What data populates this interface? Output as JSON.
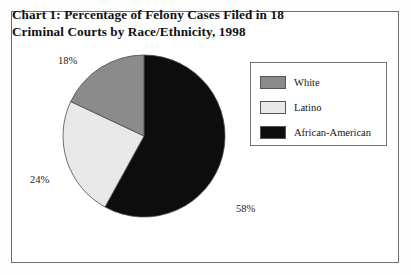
{
  "chart_data": {
    "type": "pie",
    "title": "Chart 1: Percentage of Felony Cases Filed in 18 Criminal Courts by Race/Ethnicity, 1998",
    "title_lines": [
      "Chart 1: Percentage of Felony Cases Filed in 18",
      "Criminal Courts by Race/Ethnicity, 1998"
    ],
    "categories": [
      "African-American",
      "Latino",
      "White"
    ],
    "values": [
      58,
      24,
      18
    ],
    "value_labels": [
      "58%",
      "24%",
      "18%"
    ],
    "slice_colors": [
      "#0d0d0d",
      "#e9e9e9",
      "#8b8b8b"
    ],
    "xlabel": "",
    "ylabel": "",
    "grid": false,
    "legend_position": "right",
    "start_angle_deg": 0,
    "direction": "clockwise",
    "slices": [
      {
        "label": "African-American",
        "value": 58,
        "value_label": "58%",
        "color": "#0d0d0d"
      },
      {
        "label": "Latino",
        "value": 24,
        "value_label": "24%",
        "color": "#e9e9e9"
      },
      {
        "label": "White",
        "value": 18,
        "value_label": "18%",
        "color": "#8b8b8b"
      }
    ]
  },
  "legend": {
    "entries": [
      {
        "label": "White",
        "color": "#8b8b8b"
      },
      {
        "label": "Latino",
        "color": "#e9e9e9"
      },
      {
        "label": "African-American",
        "color": "#0d0d0d"
      }
    ]
  },
  "labels": {
    "white_pct": "18%",
    "latino_pct": "24%",
    "african_american_pct": "58%"
  }
}
